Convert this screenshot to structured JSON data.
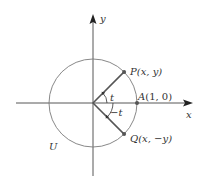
{
  "diagram": {
    "colors": {
      "axis": "#333333",
      "circle": "#7a7a7a",
      "radius": "#555555",
      "point": "#555555",
      "text": "#333333",
      "background": "#ffffff"
    },
    "axes": {
      "x_label": "x",
      "y_label": "y"
    },
    "circle": {
      "label": "U"
    },
    "points": {
      "P": {
        "name": "P",
        "coords": "(x, y)"
      },
      "A": {
        "name": "A",
        "coords": "(1, 0)"
      },
      "Q": {
        "name": "Q",
        "coords": "(x, −y)"
      }
    },
    "angles": {
      "positive": "t",
      "negative_sign": "−",
      "negative": "t"
    }
  }
}
